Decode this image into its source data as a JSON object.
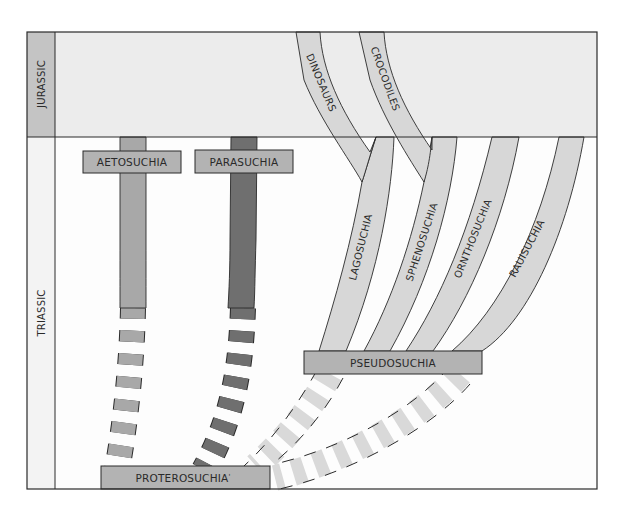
{
  "colors": {
    "jurassic_band": "#ececec",
    "triassic_bg": "#ffffff",
    "era_column_jurassic": "#c4c4c4",
    "era_column_triassic": "#f4f4f4",
    "box_fill": "#b3b3b3",
    "aetosuchia_bar": "#a8a8a8",
    "parasuchia_bar": "#6f6f6f",
    "pseudosuchia_branches": "#d7d7d7",
    "outline": "#2a2a2a"
  },
  "eras": [
    {
      "id": "jurassic",
      "label": "JURASSIC"
    },
    {
      "id": "triassic",
      "label": "TRIASSIC"
    }
  ],
  "groups": {
    "aetosuchia": "AETOSUCHIA",
    "parasuchia": "PARASUCHIA",
    "pseudosuchia": "PSEUDOSUCHIA",
    "proterosuchia": "PROTEROSUCHIA",
    "proterosuchia_mark": "'"
  },
  "branches": [
    {
      "id": "dinosaurs",
      "label": "DINOSAURS",
      "era": "Jurassic"
    },
    {
      "id": "crocodiles",
      "label": "CROCODILES",
      "era": "Jurassic"
    },
    {
      "id": "lagosuchia",
      "label": "LAGOSUCHIA",
      "era": "Triassic"
    },
    {
      "id": "sphenosuchia",
      "label": "SPHENOSUCHIA",
      "era": "Triassic"
    },
    {
      "id": "ornthosuchia",
      "label": "ORNTHOSUCHIA",
      "era": "Triassic"
    },
    {
      "id": "rauisuchia",
      "label": "RAUISUCHIA",
      "era": "Triassic"
    }
  ],
  "relationships": [
    {
      "from": "PROTEROSUCHIA",
      "to": "AETOSUCHIA",
      "style": "dashed"
    },
    {
      "from": "PROTEROSUCHIA",
      "to": "PARASUCHIA",
      "style": "dashed"
    },
    {
      "from": "PROTEROSUCHIA",
      "to": "PSEUDOSUCHIA",
      "style": "dashed"
    },
    {
      "from": "PSEUDOSUCHIA",
      "to": "LAGOSUCHIA",
      "style": "solid"
    },
    {
      "from": "PSEUDOSUCHIA",
      "to": "SPHENOSUCHIA",
      "style": "solid"
    },
    {
      "from": "PSEUDOSUCHIA",
      "to": "ORNTHOSUCHIA",
      "style": "solid"
    },
    {
      "from": "PSEUDOSUCHIA",
      "to": "RAUISUCHIA",
      "style": "solid"
    },
    {
      "from": "LAGOSUCHIA",
      "to": "DINOSAURS",
      "style": "solid"
    },
    {
      "from": "SPHENOSUCHIA",
      "to": "CROCODILES",
      "style": "solid"
    }
  ]
}
